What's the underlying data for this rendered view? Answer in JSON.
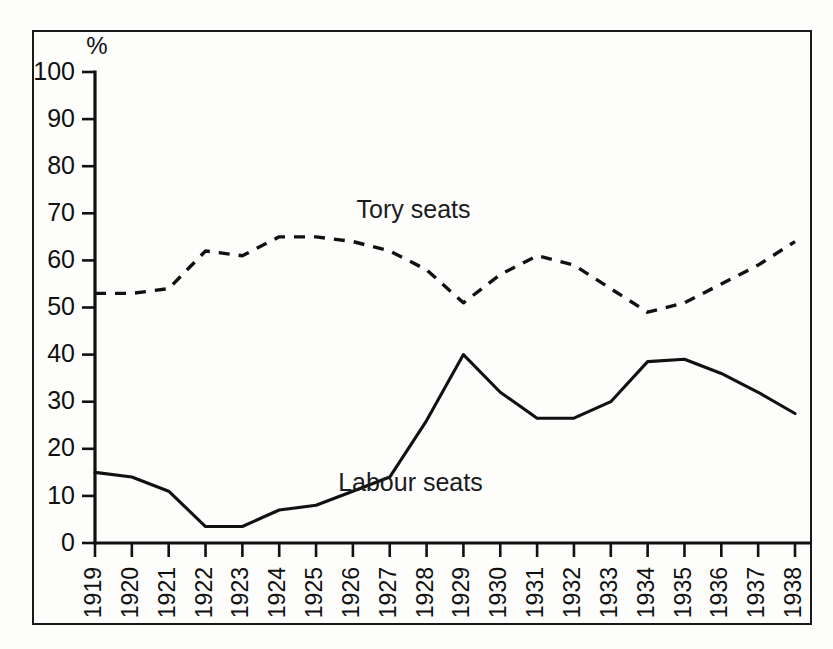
{
  "figure": {
    "frame_border_color": "#1a1a1a",
    "background_color": "#fdfdfc",
    "ink_color": "#111111"
  },
  "chart_data": {
    "type": "line",
    "title": "",
    "subtitle": "",
    "xlabel": "",
    "ylabel": "",
    "yunit_label": "%",
    "grid": false,
    "legend_position": "inline-annotation",
    "xlim": [
      1919,
      1938
    ],
    "ylim": [
      0,
      100
    ],
    "ytick_values": [
      0,
      10,
      20,
      30,
      40,
      50,
      60,
      70,
      80,
      90,
      100
    ],
    "ytick_labels": [
      "0",
      "10",
      "20",
      "30",
      "40",
      "50",
      "60",
      "70",
      "80",
      "90",
      "100"
    ],
    "x": [
      1919,
      1920,
      1921,
      1922,
      1923,
      1924,
      1925,
      1926,
      1927,
      1928,
      1929,
      1930,
      1931,
      1932,
      1933,
      1934,
      1935,
      1936,
      1937,
      1938
    ],
    "xtick_labels": [
      "1919",
      "1920",
      "1921",
      "1922",
      "1923",
      "1924",
      "1925",
      "1926",
      "1927",
      "1928",
      "1929",
      "1930",
      "1931",
      "1932",
      "1933",
      "1934",
      "1935",
      "1936",
      "1937",
      "1938"
    ],
    "categories": [
      "1919",
      "1920",
      "1921",
      "1922",
      "1923",
      "1924",
      "1925",
      "1926",
      "1927",
      "1928",
      "1929",
      "1930",
      "1931",
      "1932",
      "1933",
      "1934",
      "1935",
      "1936",
      "1937",
      "1938"
    ],
    "series": [
      {
        "name": "Tory seats",
        "style": "dashed",
        "color": "#111111",
        "label_x": 1926.1,
        "label_y": 70.5,
        "values": [
          53,
          53,
          54,
          62,
          61,
          65,
          65,
          64,
          62,
          58,
          51,
          57,
          61,
          59,
          54,
          49,
          51,
          55,
          59,
          64
        ]
      },
      {
        "name": "Labour seats",
        "style": "solid",
        "color": "#111111",
        "label_x": 1925.6,
        "label_y": 12.5,
        "values": [
          15,
          14,
          11,
          3.5,
          3.5,
          7,
          8,
          11,
          14,
          26,
          40,
          32,
          26.5,
          26.5,
          30,
          38.5,
          39,
          36,
          32,
          27.5
        ]
      }
    ],
    "annotations": [
      {
        "text": "Tory seats",
        "x": 1926.1,
        "y": 70.5
      },
      {
        "text": "Labour seats",
        "x": 1925.6,
        "y": 12.5
      }
    ]
  }
}
